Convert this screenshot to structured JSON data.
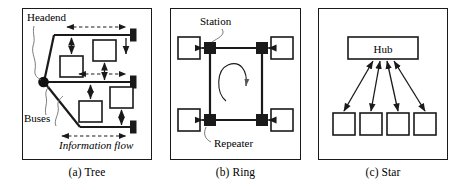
{
  "figure": {
    "background_color": "#ffffff",
    "line_color": "#1a1a1a"
  },
  "panels": [
    {
      "id": "tree",
      "caption": "(a) Tree",
      "labels": {
        "headend": "Headend",
        "buses": "Buses",
        "information_flow": "Information flow"
      },
      "elements": {
        "headend_node": "headend-dot",
        "bus_count": 3,
        "station_count": 4,
        "terminator_count": 3
      }
    },
    {
      "id": "ring",
      "caption": "(b) Ring",
      "labels": {
        "station": "Station",
        "repeater": "Repeater"
      },
      "elements": {
        "station_count": 4,
        "repeater_count": 4,
        "ring_direction": "clockwise"
      }
    },
    {
      "id": "star",
      "caption": "(c) Star",
      "labels": {
        "hub": "Hub"
      },
      "elements": {
        "hub_count": 1,
        "station_count": 4,
        "link_count": 4
      }
    }
  ]
}
